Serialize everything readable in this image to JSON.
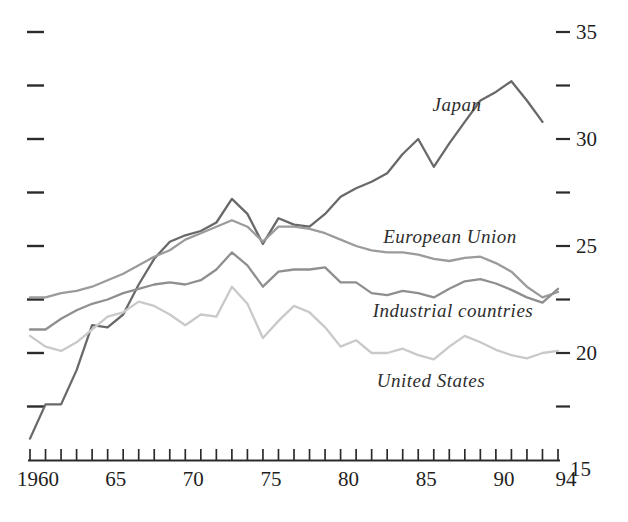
{
  "chart_data": {
    "type": "line",
    "title": "",
    "xlabel": "",
    "ylabel": "",
    "grid": false,
    "legend_position": "inline-annotations",
    "axis_color": "#2b2b2b",
    "text_color": "#1f1f1f",
    "x_range": [
      1960,
      1994
    ],
    "ylim": [
      15,
      35
    ],
    "x": [
      1960,
      1961,
      1962,
      1963,
      1964,
      1965,
      1966,
      1967,
      1968,
      1969,
      1970,
      1971,
      1972,
      1973,
      1974,
      1975,
      1976,
      1977,
      1978,
      1979,
      1980,
      1981,
      1982,
      1983,
      1984,
      1985,
      1986,
      1987,
      1988,
      1989,
      1990,
      1991,
      1992,
      1993,
      1994
    ],
    "series": [
      {
        "name": "Japan",
        "slug": "japan",
        "color": "#696969",
        "values": [
          16.0,
          17.6,
          17.6,
          19.2,
          21.3,
          21.2,
          21.8,
          23.2,
          24.4,
          25.2,
          25.5,
          25.7,
          26.1,
          27.2,
          26.5,
          25.1,
          26.3,
          26.0,
          25.9,
          26.5,
          27.3,
          27.7,
          28.0,
          28.4,
          29.3,
          30.0,
          28.7,
          29.8,
          30.8,
          31.8,
          32.2,
          32.7,
          31.8,
          30.8,
          null
        ]
      },
      {
        "name": "European Union",
        "slug": "european-union",
        "color": "#9b9b9b",
        "values": [
          22.6,
          22.6,
          22.8,
          22.9,
          23.1,
          23.4,
          23.7,
          24.1,
          24.5,
          24.8,
          25.3,
          25.6,
          25.9,
          26.2,
          25.9,
          25.2,
          25.9,
          25.9,
          25.8,
          25.6,
          25.3,
          25.0,
          24.8,
          24.7,
          24.7,
          24.6,
          24.4,
          24.3,
          24.45,
          24.5,
          24.2,
          23.8,
          23.1,
          22.6,
          22.85
        ]
      },
      {
        "name": "Industrial countries",
        "slug": "industrial-countries",
        "color": "#8f8f8f",
        "values": [
          21.1,
          21.1,
          21.6,
          22.0,
          22.3,
          22.5,
          22.8,
          23.0,
          23.2,
          23.3,
          23.2,
          23.4,
          23.9,
          24.7,
          24.1,
          23.1,
          23.8,
          23.9,
          23.9,
          24.0,
          23.3,
          23.3,
          22.8,
          22.7,
          22.9,
          22.8,
          22.6,
          23.0,
          23.35,
          23.45,
          23.25,
          22.95,
          22.6,
          22.35,
          23.0
        ]
      },
      {
        "name": "United States",
        "slug": "united-states",
        "color": "#c9c9c9",
        "values": [
          20.8,
          20.3,
          20.1,
          20.5,
          21.1,
          21.7,
          21.9,
          22.4,
          22.2,
          21.8,
          21.3,
          21.8,
          21.7,
          23.1,
          22.3,
          20.7,
          21.5,
          22.2,
          21.9,
          21.2,
          20.3,
          20.6,
          20.0,
          20.0,
          20.2,
          19.9,
          19.7,
          20.3,
          20.8,
          20.5,
          20.15,
          19.9,
          19.75,
          20.0,
          20.1
        ]
      }
    ],
    "annotations": [
      {
        "text": "Japan",
        "x": 457,
        "y": 105
      },
      {
        "text": "European Union",
        "x": 450,
        "y": 237
      },
      {
        "text": "Industrial countries",
        "x": 453,
        "y": 311
      },
      {
        "text": "United States",
        "x": 431,
        "y": 381
      }
    ],
    "x_axis": {
      "tick_start_year": 1960,
      "tick_end_year": 1994,
      "labels": [
        {
          "year": 1960,
          "text": "1960"
        },
        {
          "year": 1965,
          "text": "65"
        },
        {
          "year": 1970,
          "text": "70"
        },
        {
          "year": 1975,
          "text": "75"
        },
        {
          "year": 1980,
          "text": "80"
        },
        {
          "year": 1985,
          "text": "85"
        },
        {
          "year": 1990,
          "text": "90"
        },
        {
          "year": 1994,
          "text": "94"
        }
      ]
    },
    "y_axis": {
      "tick_values": [
        35,
        32.5,
        30,
        27.5,
        25,
        22.5,
        20,
        17.5
      ],
      "right_labels": [
        {
          "value": 35,
          "text": "35"
        },
        {
          "value": 30,
          "text": "30"
        },
        {
          "value": 25,
          "text": "25"
        },
        {
          "value": 20,
          "text": "20"
        },
        {
          "value": 15,
          "text": "15"
        }
      ]
    }
  }
}
